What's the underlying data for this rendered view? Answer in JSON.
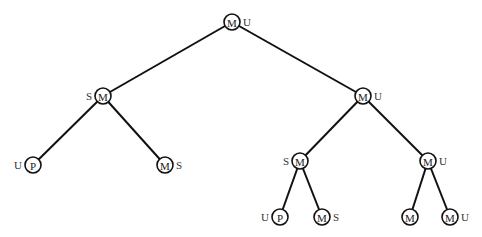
{
  "diagram": {
    "type": "tree",
    "nodes": [
      {
        "id": "n0",
        "x": 232,
        "y": 22,
        "label": "M",
        "side_label": "U",
        "side": "right"
      },
      {
        "id": "n1",
        "x": 103,
        "y": 96,
        "label": "M",
        "side_label": "S",
        "side": "left"
      },
      {
        "id": "n2",
        "x": 363,
        "y": 96,
        "label": "M",
        "side_label": "U",
        "side": "right"
      },
      {
        "id": "n3",
        "x": 33,
        "y": 165,
        "label": "P",
        "side_label": "U",
        "side": "left"
      },
      {
        "id": "n4",
        "x": 165,
        "y": 165,
        "label": "M",
        "side_label": "S",
        "side": "right"
      },
      {
        "id": "n5",
        "x": 300,
        "y": 161,
        "label": "M",
        "side_label": "S",
        "side": "left"
      },
      {
        "id": "n6",
        "x": 428,
        "y": 161,
        "label": "M",
        "side_label": "U",
        "side": "right"
      },
      {
        "id": "n7",
        "x": 280,
        "y": 217,
        "label": "P",
        "side_label": "U",
        "side": "left"
      },
      {
        "id": "n8",
        "x": 322,
        "y": 217,
        "label": "M",
        "side_label": "S",
        "side": "right"
      },
      {
        "id": "n9",
        "x": 410,
        "y": 217,
        "label": "M",
        "side_label": "",
        "side": "right"
      },
      {
        "id": "n10",
        "x": 450,
        "y": 217,
        "label": "M",
        "side_label": "U",
        "side": "right"
      }
    ],
    "edges": [
      [
        "n0",
        "n1"
      ],
      [
        "n0",
        "n2"
      ],
      [
        "n1",
        "n3"
      ],
      [
        "n1",
        "n4"
      ],
      [
        "n2",
        "n5"
      ],
      [
        "n2",
        "n6"
      ],
      [
        "n5",
        "n7"
      ],
      [
        "n5",
        "n8"
      ],
      [
        "n6",
        "n9"
      ],
      [
        "n6",
        "n10"
      ]
    ]
  }
}
